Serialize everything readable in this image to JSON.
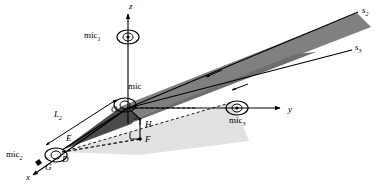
{
  "figure": {
    "background": "#ffffff",
    "width": 382,
    "height": 196
  },
  "colors": {
    "line": "#000000",
    "dark_plane": "#808080",
    "dark_plane_edge": "#5a5a5a",
    "light_plane": "#e2e2e2",
    "background": "#ffffff"
  },
  "axes": [
    {
      "name": "z-axis",
      "label": "z",
      "label_x": 129,
      "label_y": 4
    },
    {
      "name": "y-axis",
      "label": "y",
      "label_x": 288,
      "label_y": 110
    },
    {
      "name": "x-axis",
      "label": "x",
      "label_x": 26,
      "label_y": 178
    }
  ],
  "microphones": [
    {
      "name": "mic-1",
      "label": "mic",
      "sub": "1",
      "label_x": 84,
      "label_y": 26,
      "axis": "z"
    },
    {
      "name": "mic-center",
      "label": "mic",
      "sub": "",
      "label_x": 128,
      "label_y": 84,
      "axis": "origin"
    },
    {
      "name": "mic-3",
      "label": "mic",
      "sub": "3",
      "label_x": 229,
      "label_y": 115,
      "axis": "y"
    },
    {
      "name": "mic-2",
      "label": "mic",
      "sub": "2",
      "label_x": 7,
      "label_y": 150,
      "axis": "x"
    }
  ],
  "rays": [
    {
      "name": "ray-s2",
      "label": "s",
      "sub": "2",
      "label_x": 362,
      "label_y": 8
    },
    {
      "name": "ray-s3",
      "label": "s",
      "sub": "3",
      "label_x": 355,
      "label_y": 45
    }
  ],
  "points": [
    {
      "name": "point-O",
      "label": "O",
      "label_x": 111,
      "label_y": 106
    },
    {
      "name": "point-H",
      "label": "H",
      "label_x": 147,
      "label_y": 125
    },
    {
      "name": "point-F",
      "label": "F",
      "label_x": 147,
      "label_y": 140
    },
    {
      "name": "point-E",
      "label": "E",
      "label_x": 66,
      "label_y": 137
    },
    {
      "name": "point-D",
      "label": "D",
      "label_x": 62,
      "label_y": 156
    },
    {
      "name": "point-G",
      "label": "G",
      "label_x": 44,
      "label_y": 164
    }
  ],
  "dimensions": [
    {
      "name": "length-L2",
      "label": "L",
      "sub": "2",
      "label_x": 54,
      "label_y": 113
    }
  ]
}
